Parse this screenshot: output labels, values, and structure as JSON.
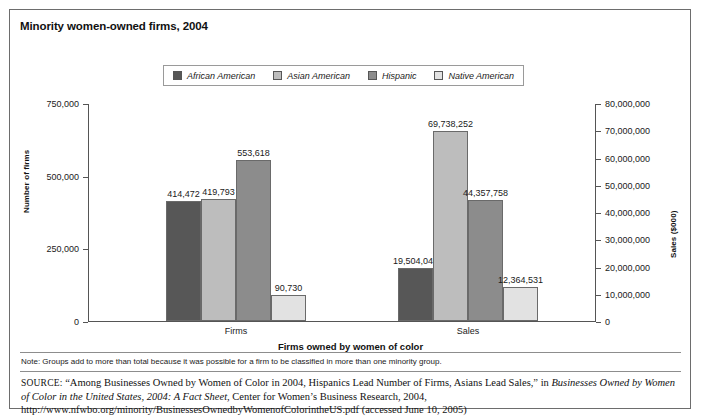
{
  "figure": {
    "title": "Minority women-owned firms, 2004",
    "note": "Note: Groups add to more than total because it was possible for a firm to be classified in more than one minority group.",
    "source_prefix": "SOURCE:",
    "source_part1": " “Among Businesses Owned by Women of Color in 2004, Hispanics Lead Number of Firms, Asians Lead Sales,” in ",
    "source_italic1": "Businesses Owned by Women of Color in the United States, 2004: A Fact Sheet",
    "source_part2": ", Center for Women’s Business Research, 2004, http://www.nfwbo.org/minority/BusinessesOwnedbyWomenofColorintheUS.pdf (accessed June 10, 2005)"
  },
  "chart_data": {
    "type": "bar",
    "title": "Minority women-owned firms, 2004",
    "categories": [
      "Firms",
      "Sales"
    ],
    "xlabel": "Firms owned by women of color",
    "ylabel": "Number of firms",
    "ylabel_right": "Sales ($000)",
    "ylim": [
      0,
      750000
    ],
    "ylim_right": [
      0,
      80000000
    ],
    "yticks": [
      0,
      250000,
      500000,
      750000
    ],
    "ytick_labels": [
      "0",
      "250,000",
      "500,000",
      "750,000"
    ],
    "yticks_right": [
      0,
      10000000,
      20000000,
      30000000,
      40000000,
      50000000,
      60000000,
      70000000,
      80000000
    ],
    "ytick_labels_right": [
      "0",
      "10,000,000",
      "20,000,000",
      "30,000,000",
      "40,000,000",
      "50,000,000",
      "60,000,000",
      "70,000,000",
      "80,000,000"
    ],
    "grid": false,
    "legend_position": "top",
    "series": [
      {
        "name": "African American",
        "color": "#575757",
        "values": [
          414472,
          19504040
        ],
        "labels": [
          "414,472",
          "19,504,040"
        ]
      },
      {
        "name": "Asian American",
        "color": "#bdbdbd",
        "values": [
          419793,
          69738252
        ],
        "labels": [
          "419,793",
          "69,738,252"
        ]
      },
      {
        "name": "Hispanic",
        "color": "#8c8c8c",
        "values": [
          553618,
          44357758
        ],
        "labels": [
          "553,618",
          "44,357,758"
        ]
      },
      {
        "name": "Native American",
        "color": "#e2e2e2",
        "values": [
          90730,
          12364531
        ],
        "labels": [
          "90,730",
          "12,364,531"
        ]
      }
    ]
  }
}
